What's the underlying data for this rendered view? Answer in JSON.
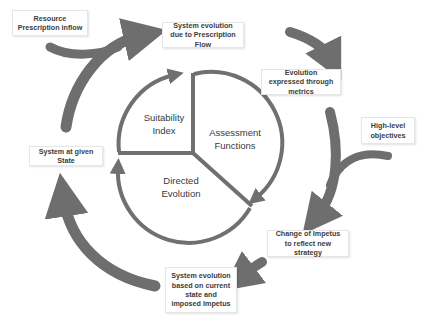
{
  "colors": {
    "arrow": "#6e6e6e",
    "box_border": "#e6e6e6",
    "text": "#3c3c3c",
    "background": "#ffffff"
  },
  "outer_boxes": {
    "resource_inflow": "Resource Prescription inflow",
    "evolution_prescription": "System evolution due to Prescription Flow",
    "evolution_metrics": "Evolution expressed through metrics",
    "high_level_objectives": "High-level objectives",
    "change_impetus": "Change of Impetus to reflect new strategy",
    "evolution_current_state": "System evolution based on current state and imposed Impetus",
    "system_given_state": "System at given State"
  },
  "inner_cycle": {
    "segments": [
      {
        "label": "Suitability Index"
      },
      {
        "label": "Assessment Functions"
      },
      {
        "label": "Directed Evolution"
      }
    ]
  }
}
